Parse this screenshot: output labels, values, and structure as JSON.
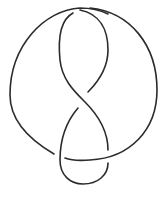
{
  "diagram": {
    "type": "knot-diagram",
    "description": "Knot diagram drawn as a single closed strand with crossings (twist-knot style)",
    "stroke_color": "#2b2b2b",
    "background": "#ffffff",
    "stroke_width": 1.6,
    "crossings": 3,
    "strands": [
      {
        "id": "outer-left-arc",
        "label": "outer arc (left, over top)"
      },
      {
        "id": "outer-right-arc",
        "label": "outer arc (right, down to bottom)"
      },
      {
        "id": "inner-left-strand",
        "label": "inner strand (left, to middle crossing)"
      },
      {
        "id": "inner-right-strand",
        "label": "inner strand (right, under at middle)"
      },
      {
        "id": "lower-loop",
        "label": "lower loop"
      }
    ]
  }
}
